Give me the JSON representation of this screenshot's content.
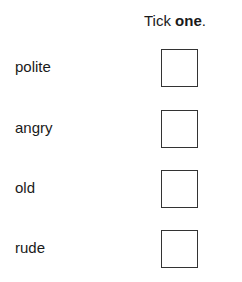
{
  "header": {
    "prefix": "Tick ",
    "emphasis": "one",
    "suffix": "."
  },
  "options": [
    {
      "label": "polite",
      "checked": false
    },
    {
      "label": "angry",
      "checked": false
    },
    {
      "label": "old",
      "checked": false
    },
    {
      "label": "rude",
      "checked": false
    }
  ]
}
